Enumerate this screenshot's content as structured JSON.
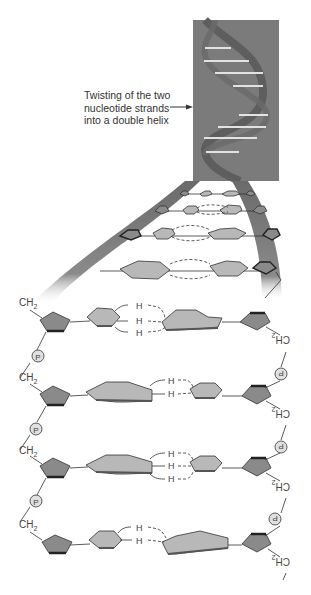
{
  "diagram": {
    "callout": {
      "lines": [
        "Twisting of the two",
        "nucleotide strands",
        "into a double helix"
      ],
      "arrow": "right-arrow"
    },
    "labels": {
      "ch2": "CH",
      "ch2_sub": "2",
      "phosphate": "P",
      "hydrogen": "H"
    },
    "base_pairs": [
      {
        "index": 1,
        "hydrogen_bonds": 3,
        "left_base": "pyrimidine",
        "right_base": "purine"
      },
      {
        "index": 2,
        "hydrogen_bonds": 2,
        "left_base": "purine",
        "right_base": "pyrimidine"
      },
      {
        "index": 3,
        "hydrogen_bonds": 3,
        "left_base": "purine",
        "right_base": "pyrimidine"
      },
      {
        "index": 4,
        "hydrogen_bonds": 2,
        "left_base": "pyrimidine",
        "right_base": "purine"
      }
    ],
    "colors": {
      "helix_box": "#7a7a7a",
      "strand": "#6e6e6e",
      "base": "#b8b8b8",
      "sugar": "#8a8a8a",
      "sugar_dark": "#3c3c3c",
      "rung": "#e6e6e6"
    }
  }
}
